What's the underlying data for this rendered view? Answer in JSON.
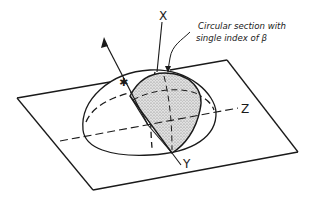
{
  "figure": {
    "axes": {
      "x_label": "X",
      "y_label": "Y",
      "z_label": "Z"
    },
    "annotation": {
      "line1": "Circular section with",
      "line2": "single index of β"
    },
    "optic_axis_marker": "✱",
    "colors": {
      "ink": "#1a1a1a",
      "shade": "#c9c9c9",
      "background": "#ffffff"
    }
  }
}
